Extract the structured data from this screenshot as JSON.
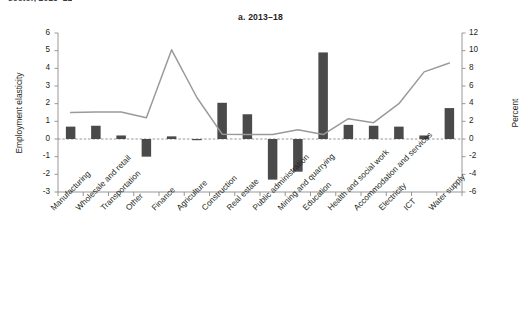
{
  "caption_remnant": "sector, 2013–21",
  "panel_title": "a. 2013–18",
  "axes": {
    "left_title": "Employment elasticity",
    "right_title": "Percent",
    "left_ticks": [
      6,
      5,
      4,
      3,
      2,
      1,
      0,
      -1,
      -2,
      -3
    ],
    "right_ticks": [
      12,
      10,
      8,
      6,
      4,
      2,
      0,
      -2,
      -4,
      -6
    ]
  },
  "colors": {
    "bar": "#4a4a4a",
    "line": "#9a9a9a",
    "axis": "#8c8c8c",
    "zero_line": "#8c8c8c",
    "text": "#231f20",
    "background": "#ffffff"
  },
  "chart_data": {
    "type": "bar",
    "title": "a. 2013–18",
    "xlabel": "",
    "ylabel": "Employment elasticity",
    "y2label": "Percent",
    "ylim": [
      -3,
      6
    ],
    "y2lim": [
      -6,
      12
    ],
    "grid": false,
    "legend": "none",
    "categories": [
      "Manufacturing",
      "Wholesale and retail",
      "Transportation",
      "Other",
      "Finance",
      "Agriculture",
      "Construction",
      "Real estate",
      "Public administration",
      "Mining and quarrying",
      "Education",
      "Health and social work",
      "Accommodation and services",
      "Electricity",
      "ICT",
      "Water supply"
    ],
    "series": [
      {
        "name": "Employment elasticity",
        "type": "bar",
        "axis": "left",
        "values": [
          0.7,
          0.75,
          0.2,
          -1.0,
          0.15,
          -0.05,
          2.05,
          1.4,
          -2.3,
          -1.85,
          4.9,
          0.8,
          0.75,
          0.7,
          0.2,
          1.75
        ]
      },
      {
        "name": "Percent",
        "type": "line",
        "axis": "right",
        "values": [
          3.0,
          3.05,
          3.05,
          2.4,
          10.1,
          4.7,
          0.55,
          0.5,
          0.5,
          1.05,
          0.5,
          2.3,
          1.85,
          4.0,
          7.6,
          8.6
        ]
      }
    ]
  }
}
